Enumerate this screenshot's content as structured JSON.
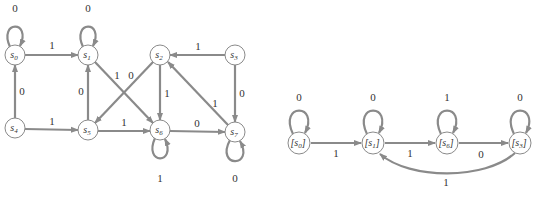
{
  "left_diagram": {
    "title": "Finite-state machine M",
    "states": [
      {
        "id": "s0",
        "label": "s",
        "sub": "0",
        "x": 15,
        "y": 55
      },
      {
        "id": "s1",
        "label": "s",
        "sub": "1",
        "x": 88,
        "y": 55
      },
      {
        "id": "s2",
        "label": "s",
        "sub": "2",
        "x": 160,
        "y": 55
      },
      {
        "id": "s3",
        "label": "s",
        "sub": "3",
        "x": 235,
        "y": 55
      },
      {
        "id": "s4",
        "label": "s",
        "sub": "4",
        "x": 15,
        "y": 128
      },
      {
        "id": "s5",
        "label": "s",
        "sub": "5",
        "x": 88,
        "y": 130
      },
      {
        "id": "s6",
        "label": "s",
        "sub": "6",
        "x": 160,
        "y": 130
      },
      {
        "id": "s7",
        "label": "s",
        "sub": "7",
        "x": 235,
        "y": 132
      }
    ],
    "transitions": [
      {
        "from": "s0",
        "to": "s0",
        "input": "0"
      },
      {
        "from": "s0",
        "to": "s1",
        "input": "1"
      },
      {
        "from": "s1",
        "to": "s1",
        "input": "0"
      },
      {
        "from": "s1",
        "to": "s6",
        "input": "1"
      },
      {
        "from": "s2",
        "to": "s5",
        "input": "0"
      },
      {
        "from": "s2",
        "to": "s6",
        "input": "1"
      },
      {
        "from": "s3",
        "to": "s2",
        "input": "1"
      },
      {
        "from": "s3",
        "to": "s7",
        "input": "0"
      },
      {
        "from": "s4",
        "to": "s0",
        "input": "0"
      },
      {
        "from": "s4",
        "to": "s5",
        "input": "1"
      },
      {
        "from": "s5",
        "to": "s1",
        "input": "0"
      },
      {
        "from": "s5",
        "to": "s6",
        "input": "1"
      },
      {
        "from": "s6",
        "to": "s6",
        "input": "1"
      },
      {
        "from": "s6",
        "to": "s7",
        "input": "0"
      },
      {
        "from": "s7",
        "to": "s7",
        "input": "0"
      },
      {
        "from": "s7",
        "to": "s2",
        "input": "1"
      }
    ],
    "labels": {
      "s0_loop": "0",
      "s0_s1": "1",
      "s1_loop": "0",
      "s1_s6": "1",
      "s2_s5": "0",
      "s2_s6": "1",
      "s3_s2": "1",
      "s3_s7": "0",
      "s4_s0": "0",
      "s4_s5": "1",
      "s5_s1": "0",
      "s5_s6": "1",
      "s6_loop": "1",
      "s6_s7": "0",
      "s7_loop": "0",
      "s7_s2": "1"
    },
    "node_text": {
      "s": "s",
      "n0": "0",
      "n1": "1",
      "n2": "2",
      "n3": "3",
      "n4": "4",
      "n5": "5",
      "n6": "6",
      "n7": "7"
    }
  },
  "right_diagram": {
    "title": "Minimized machine",
    "states": [
      {
        "id": "[s0]",
        "label": "[s",
        "sub": "0",
        "x": 299,
        "y": 143
      },
      {
        "id": "[s1]",
        "label": "[s",
        "sub": "1",
        "x": 373,
        "y": 143
      },
      {
        "id": "[s6]",
        "label": "[s",
        "sub": "6",
        "x": 447,
        "y": 143
      },
      {
        "id": "[s3]",
        "label": "[s",
        "sub": "3",
        "x": 520,
        "y": 143
      }
    ],
    "transitions": [
      {
        "from": "[s0]",
        "to": "[s0]",
        "input": "0"
      },
      {
        "from": "[s0]",
        "to": "[s1]",
        "input": "1"
      },
      {
        "from": "[s1]",
        "to": "[s1]",
        "input": "0"
      },
      {
        "from": "[s1]",
        "to": "[s6]",
        "input": "1"
      },
      {
        "from": "[s6]",
        "to": "[s6]",
        "input": "1"
      },
      {
        "from": "[s6]",
        "to": "[s3]",
        "input": "0"
      },
      {
        "from": "[s3]",
        "to": "[s3]",
        "input": "0"
      },
      {
        "from": "[s3]",
        "to": "[s1]",
        "input": "1"
      }
    ],
    "labels": {
      "s0_loop": "0",
      "s0_s1": "1",
      "s1_loop": "0",
      "s1_s6": "1",
      "s6_loop": "1",
      "s6_s3": "0",
      "s3_loop": "0",
      "s3_s1": "1"
    },
    "node_text": {
      "open": "[s",
      "close": "]",
      "n0": "0",
      "n1": "1",
      "n6": "6",
      "n3": "3"
    }
  },
  "colors": {
    "edge": "#8a8a8a",
    "text": "#333333",
    "background": "#ffffff"
  }
}
